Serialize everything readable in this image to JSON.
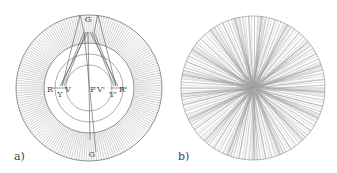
{
  "figure": {
    "panels": [
      {
        "id": "a",
        "label": "a)",
        "center": [
          89,
          88
        ],
        "outer_radius": 73,
        "ring_inner_radius": 45,
        "ray_count": 180,
        "inner_circles": [
          {
            "cx": 89,
            "cy": 88,
            "r": 34
          },
          {
            "cx": 89,
            "cy": 88,
            "r": 23
          }
        ],
        "points": {
          "G_top": {
            "text": "G",
            "x": 88,
            "y": 22
          },
          "G_bottom": {
            "text": "G",
            "x": 92,
            "y": 157
          },
          "R": {
            "text": "R",
            "x": 50,
            "y": 92
          },
          "Y_left": {
            "text": "Y",
            "x": 60,
            "y": 97
          },
          "V_left": {
            "text": "V",
            "x": 68,
            "y": 92
          },
          "F": {
            "text": "F",
            "x": 93,
            "y": 92
          },
          "V_right": {
            "text": "V'",
            "x": 101,
            "y": 92
          },
          "Y_right": {
            "text": "Y'",
            "x": 113,
            "y": 97
          },
          "R_right": {
            "text": "R'",
            "x": 123,
            "y": 92
          }
        }
      },
      {
        "id": "b",
        "label": "b)",
        "center": [
          253,
          88
        ],
        "radius": 72,
        "ray_count": 150
      }
    ],
    "colors": {
      "line": "#8a8a8a",
      "dark_line": "#555555",
      "text": "#444444"
    }
  }
}
